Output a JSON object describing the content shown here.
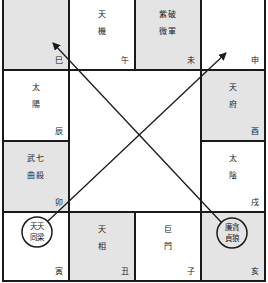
{
  "chart": {
    "palaces": [
      {
        "id": "si",
        "branch": "巳",
        "stars_line1": "",
        "stars_line2": "",
        "shaded": true
      },
      {
        "id": "wu",
        "branch": "午",
        "stars_line1": "天",
        "stars_line2": "機",
        "shaded": false
      },
      {
        "id": "wei",
        "branch": "未",
        "stars_line1": "紫破",
        "stars_line2": "微軍",
        "shaded": true
      },
      {
        "id": "shen",
        "branch": "申",
        "stars_line1": "",
        "stars_line2": "",
        "shaded": false
      },
      {
        "id": "chen",
        "branch": "辰",
        "stars_line1": "太",
        "stars_line2": "陽",
        "shaded": false
      },
      {
        "id": "you",
        "branch": "酉",
        "stars_line1": "天",
        "stars_line2": "府",
        "shaded": true
      },
      {
        "id": "mao",
        "branch": "卯",
        "stars_line1": "武七",
        "stars_line2": "曲殺",
        "shaded": true
      },
      {
        "id": "xu",
        "branch": "戌",
        "stars_line1": "太",
        "stars_line2": "陰",
        "shaded": false
      },
      {
        "id": "yin",
        "branch": "寅",
        "stars_line1": "天天",
        "stars_line2": "同梁",
        "shaded": false,
        "circled": true
      },
      {
        "id": "chou",
        "branch": "丑",
        "stars_line1": "天",
        "stars_line2": "相",
        "shaded": true
      },
      {
        "id": "zi",
        "branch": "子",
        "stars_line1": "巨",
        "stars_line2": "門",
        "shaded": false
      },
      {
        "id": "hai",
        "branch": "亥",
        "stars_line1": "廉貪",
        "stars_line2": "貞狼",
        "shaded": true,
        "circled": true
      }
    ],
    "arrows": [
      {
        "from": "亥",
        "to": "巳"
      },
      {
        "from": "寅",
        "to": "申"
      }
    ],
    "colors": {
      "shaded": "#e4e4e4",
      "line": "#1a1a1a",
      "background": "#ffffff"
    }
  }
}
